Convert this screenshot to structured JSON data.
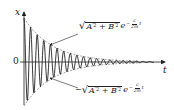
{
  "figure": {
    "type": "damped-oscillation-diagram",
    "axes": {
      "y_label": "x",
      "x_label": "t",
      "origin_label": "0"
    },
    "annotations": {
      "upper_envelope": {
        "prefix": "",
        "radicand_a": "A",
        "radicand_b": "B",
        "prime_sq": "′2",
        "plus": "+",
        "base": "e",
        "exp_sign": "−",
        "exp_num": "c",
        "exp_den": "2m",
        "exp_var": "t"
      },
      "lower_envelope": {
        "prefix": "−",
        "radicand_a": "A",
        "radicand_b": "B",
        "prime_sq": "′2",
        "plus": "+",
        "base": "e",
        "exp_sign": "−",
        "exp_num": "c",
        "exp_den": "2m",
        "exp_var": "t"
      }
    },
    "colors": {
      "curve": "#222222",
      "envelope": "#555555",
      "axis": "#222222"
    }
  }
}
